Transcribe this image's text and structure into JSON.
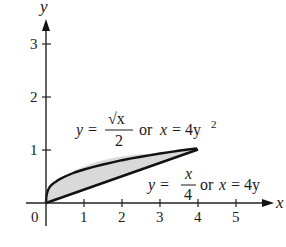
{
  "figure": {
    "axes": {
      "x_label": "x",
      "y_label": "y",
      "origin_label": "0",
      "x_ticks": [
        "1",
        "2",
        "3",
        "4",
        "5"
      ],
      "y_ticks": [
        "1",
        "2",
        "3"
      ]
    },
    "curves": [
      {
        "name": "upper-curve",
        "equation_lhs": "y =",
        "numerator": "√x",
        "denominator": "2",
        "connector": "or",
        "alt_lhs": "x",
        "alt_rhs": "= 4y",
        "alt_exponent": "2"
      },
      {
        "name": "lower-line",
        "equation_lhs": "y =",
        "numerator": "x",
        "denominator": "4",
        "connector": "or",
        "alt_lhs": "x",
        "alt_rhs": "= 4y"
      }
    ],
    "region": {
      "description": "Shaded region between y = √x/2 and y = x/4 from x=0 to x=4",
      "fill_color": "#d9d9d9",
      "stroke_color": "#111111",
      "intersections": [
        [
          0,
          0
        ],
        [
          4,
          1
        ]
      ]
    },
    "colors": {
      "axis": "#222222",
      "curve": "#111111",
      "shade": "#d9d9d9"
    }
  }
}
